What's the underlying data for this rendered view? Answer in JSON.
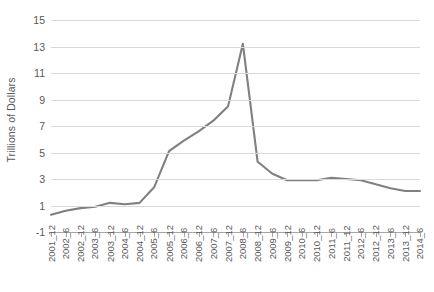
{
  "chart_data": {
    "type": "line",
    "title": "",
    "xlabel": "",
    "ylabel": "Trillions of Dollars",
    "ylim": [
      -1,
      15
    ],
    "yticks": [
      15,
      13,
      11,
      9,
      7,
      5,
      3,
      1,
      -1
    ],
    "grid": true,
    "legend": "none",
    "line_color": "#808080",
    "categories": [
      "2001_12",
      "2002_6",
      "2002_12",
      "2003_6",
      "2003_12",
      "2004_6",
      "2004_12",
      "2005_6",
      "2005_12",
      "2006_6",
      "2006_12",
      "2007_6",
      "2007_12",
      "2008_6",
      "2008_12",
      "2009_6",
      "2009_12",
      "2010_6",
      "2010_12",
      "2011_6",
      "2011_12",
      "2012_6",
      "2012_12",
      "2013_6",
      "2013_12",
      "2014_6"
    ],
    "values": [
      0.3,
      0.6,
      0.8,
      0.9,
      1.2,
      1.1,
      1.2,
      2.4,
      5.1,
      5.9,
      6.6,
      7.4,
      8.5,
      13.2,
      4.3,
      3.4,
      2.9,
      2.9,
      2.9,
      3.1,
      3.0,
      2.9,
      2.6,
      2.3,
      2.1,
      2.1
    ],
    "series": [
      {
        "name": "",
        "values": [
          0.3,
          0.6,
          0.8,
          0.9,
          1.2,
          1.1,
          1.2,
          2.4,
          5.1,
          5.9,
          6.6,
          7.4,
          8.5,
          13.2,
          4.3,
          3.4,
          2.9,
          2.9,
          2.9,
          3.1,
          3.0,
          2.9,
          2.6,
          2.3,
          2.1,
          2.1
        ]
      }
    ]
  }
}
